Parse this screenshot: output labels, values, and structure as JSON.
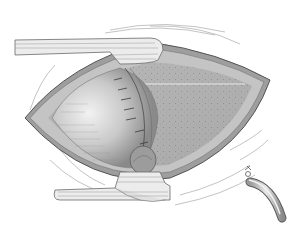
{
  "illustration": {
    "subject": "surgical-incision-with-retractors",
    "colors": {
      "background": "#ffffff",
      "skin_outline": "#5a5a5a",
      "cavity_dark": "#8e8e8e",
      "organ_light": "#d8d8d8",
      "organ_shade": "#a6a6a6",
      "speckle_field": "#b4b4b4",
      "retractor": "#ececec",
      "retractor_edge": "#6a6a6a"
    }
  }
}
